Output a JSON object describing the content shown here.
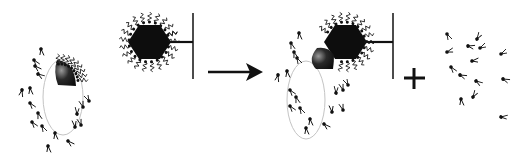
{
  "diagram": {
    "operators": {
      "arrow": "reaction-arrow",
      "plus": "+"
    },
    "colors": {
      "ink": "#111111",
      "membrane": "#bbbbbb",
      "patch_dark": "#1a1a1a",
      "patch_light": "#888888",
      "background": "#ffffff"
    },
    "panels": [
      {
        "id": "cell-with-patch",
        "shapes": [
          "ellipse-membrane",
          "dark-patch",
          "tethered-molecules"
        ]
      },
      {
        "id": "hexagon-particle-on-support",
        "shapes": [
          "hexagon",
          "wavy-ligands",
          "stem",
          "support-bar"
        ]
      },
      {
        "id": "bound-complex",
        "shapes": [
          "ellipse-membrane",
          "dark-patch",
          "hexagon",
          "support-bar"
        ]
      },
      {
        "id": "released-molecules",
        "shapes": [
          "free-molecules"
        ]
      }
    ]
  }
}
